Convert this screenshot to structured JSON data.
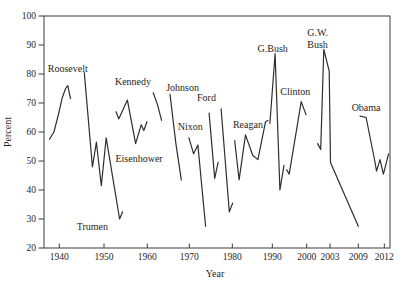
{
  "figure_title": "Presidential approval by president over time",
  "chart_data": {
    "type": "line",
    "title": "",
    "xlabel": "Year",
    "ylabel": "Percent",
    "ylim": [
      20,
      100
    ],
    "xlim_years": [
      1936.5,
      2013.3
    ],
    "grid": false,
    "legend_position": "inline-labels",
    "line_color": "#2f2e2d",
    "axis_color": "#3c3c3c",
    "text_color": "#1f1e1d",
    "yticks": [
      20,
      30,
      40,
      50,
      60,
      70,
      80,
      90,
      100
    ],
    "xticks": [
      1940,
      1950,
      1960,
      1970,
      1980,
      1990,
      2000,
      2003,
      2009,
      2012
    ],
    "series": [
      {
        "id": "roosevelt",
        "label_lines": [
          "Roosevelt"
        ],
        "label_at": [
          1941.9,
          82.0
        ],
        "points": [
          [
            1937.8,
            57.5
          ],
          [
            1938.8,
            60
          ],
          [
            1939.8,
            66
          ],
          [
            1940.7,
            72
          ],
          [
            1941.4,
            75
          ],
          [
            1941.9,
            76
          ],
          [
            1942.5,
            71.5
          ]
        ]
      },
      {
        "id": "truman",
        "label_lines": [
          "Trumen"
        ],
        "label_at": [
          1947.4,
          27.5
        ],
        "points": [
          [
            1945.6,
            80.5
          ],
          [
            1947.4,
            48
          ],
          [
            1948.3,
            56.5
          ],
          [
            1949.4,
            41.5
          ],
          [
            1950.5,
            58
          ],
          [
            1953.6,
            30
          ],
          [
            1954.3,
            32.5
          ]
        ]
      },
      {
        "id": "eisenhower",
        "label_lines": [
          "Eisenhower"
        ],
        "label_at": [
          1958.1,
          51.0
        ],
        "points": [
          [
            1952.8,
            67
          ],
          [
            1953.4,
            64.5
          ],
          [
            1955.4,
            71
          ],
          [
            1957.3,
            56
          ],
          [
            1958.6,
            62.5
          ],
          [
            1959.2,
            60.5
          ],
          [
            1959.9,
            63.5
          ]
        ]
      },
      {
        "id": "kennedy",
        "label_lines": [
          "Kennedy"
        ],
        "label_at": [
          1956.7,
          77.5
        ],
        "points": [
          [
            1961.4,
            73.5
          ],
          [
            1962.4,
            69.5
          ],
          [
            1963.4,
            64
          ]
        ]
      },
      {
        "id": "johnson",
        "label_lines": [
          "Johnson"
        ],
        "label_at": [
          1968.4,
          75.5
        ],
        "points": [
          [
            1965.4,
            73
          ],
          [
            1966.8,
            56
          ],
          [
            1968.1,
            43.5
          ]
        ]
      },
      {
        "id": "nixon",
        "label_lines": [
          "Nixon"
        ],
        "label_at": [
          1970.2,
          62.0
        ],
        "points": [
          [
            1969.9,
            58
          ],
          [
            1971,
            52.5
          ],
          [
            1972,
            55.5
          ],
          [
            1973.8,
            27.5
          ]
        ]
      },
      {
        "id": "ford",
        "label_lines": [
          "Ford"
        ],
        "label_at": [
          1974.0,
          72.0
        ],
        "points": [
          [
            1974.6,
            66.5
          ],
          [
            1975.9,
            44
          ],
          [
            1976.7,
            49.5
          ]
        ]
      },
      {
        "id": "carter",
        "label_lines": [],
        "label_at": null,
        "points": [
          [
            1977.4,
            68
          ],
          [
            1979.3,
            32.5
          ],
          [
            1980.1,
            35.5
          ]
        ]
      },
      {
        "id": "reagan",
        "label_lines": [
          "Reagan"
        ],
        "label_at": [
          1983.9,
          62.5
        ],
        "points": [
          [
            1980.6,
            57
          ],
          [
            1981.7,
            43.5
          ],
          [
            1983.3,
            59
          ],
          [
            1985.1,
            52
          ],
          [
            1986.4,
            50.5
          ],
          [
            1988.3,
            63.5
          ],
          [
            1988.9,
            64
          ]
        ]
      },
      {
        "id": "g-bush",
        "label_lines": [
          "G.Bush"
        ],
        "label_at": [
          1990.1,
          88.8
        ],
        "points": [
          [
            1989.4,
            63
          ],
          [
            1990.8,
            87
          ],
          [
            1992.2,
            40
          ],
          [
            1993.4,
            48.5
          ]
        ]
      },
      {
        "id": "clinton",
        "label_lines": [
          "Clinton"
        ],
        "label_at": [
          1996.7,
          74.0
        ],
        "points": [
          [
            1994.2,
            47
          ],
          [
            1994.9,
            45.5
          ],
          [
            1998.4,
            70.5
          ],
          [
            1999.8,
            66
          ]
        ]
      },
      {
        "id": "gw-bush",
        "label_lines": [
          "G.W.",
          "Bush"
        ],
        "label_at": [
          2001.4,
          94.3
        ],
        "points": [
          [
            2001.4,
            56
          ],
          [
            2001.8,
            54
          ],
          [
            2002.2,
            88.5
          ],
          [
            2002.9,
            81
          ],
          [
            2003.1,
            49.5
          ],
          [
            2009,
            27.5
          ]
        ]
      },
      {
        "id": "obama",
        "label_lines": [
          "Obama"
        ],
        "label_at": [
          2009.9,
          68.5
        ],
        "points": [
          [
            2009.2,
            65.5
          ],
          [
            2009.9,
            65
          ],
          [
            2010.9,
            50
          ],
          [
            2011.1,
            46.5
          ],
          [
            2011.5,
            50.5
          ],
          [
            2011.9,
            45.5
          ],
          [
            2012.5,
            52.5
          ]
        ]
      }
    ]
  }
}
